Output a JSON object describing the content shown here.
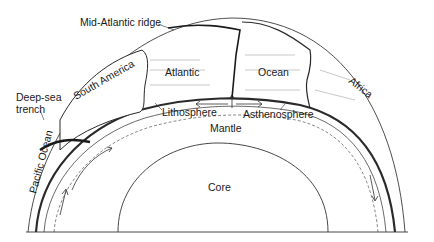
{
  "diagram": {
    "type": "earth-cross-section-plate-tectonics",
    "labels": {
      "mid_atlantic_ridge": "Mid-Atlantic ridge",
      "south_america": "South America",
      "atlantic": "Atlantic",
      "ocean": "Ocean",
      "africa": "Africa",
      "deep_sea_trench_line1": "Deep-sea",
      "deep_sea_trench_line2": "trench",
      "lithosphere": "Lithosphere",
      "asthenosphere": "Asthenosphere",
      "mantle": "Mantle",
      "core": "Core",
      "pacific_ocean": "Pacific Ocean"
    },
    "colors": {
      "line": "#2a2a2a",
      "background": "#ffffff",
      "hatch": "#555555"
    }
  }
}
